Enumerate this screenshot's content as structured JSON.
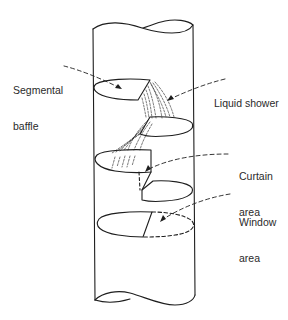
{
  "figure": {
    "labels": {
      "segmental_baffle": {
        "line1": "Segmental",
        "line2": "baffle"
      },
      "liquid_shower": {
        "line1": "Liquid shower"
      },
      "curtain_area": {
        "line1": "Curtain",
        "line2": "area"
      },
      "window_area": {
        "line1": "Window",
        "line2": "area"
      }
    },
    "colors": {
      "line": "#1e1e1e",
      "background": "#ffffff"
    }
  }
}
